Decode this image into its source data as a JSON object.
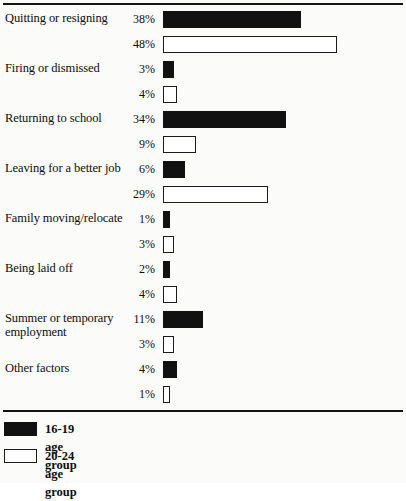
{
  "chart_data": {
    "type": "bar",
    "orientation": "horizontal",
    "title": "",
    "subtitle": "",
    "xlabel": "",
    "ylabel": "",
    "grid": false,
    "xlim": [
      0,
      50
    ],
    "value_suffix": "%",
    "legend_position": "bottom-left",
    "categories": [
      "Quitting or resigning",
      "Firing or dismissed",
      "Returning to school",
      "Leaving for a better job",
      "Family moving/relocate",
      "Being laid off",
      "Summer or temporary\nemployment",
      "Other factors"
    ],
    "series": [
      {
        "name": "16-19 age group",
        "color": "#111111",
        "style": "filled",
        "values": [
          38,
          3,
          34,
          6,
          1,
          2,
          11,
          4
        ],
        "labels": [
          "38%",
          "3%",
          "34%",
          "6%",
          "1%",
          "2%",
          "11%",
          "4%"
        ]
      },
      {
        "name": "20-24 age group",
        "color": "#ffffff",
        "style": "hollow",
        "values": [
          48,
          4,
          9,
          29,
          3,
          4,
          3,
          1
        ],
        "labels": [
          "48%",
          "4%",
          "9%",
          "29%",
          "3%",
          "4%",
          "3%",
          "1%"
        ]
      }
    ]
  },
  "legend": {
    "items": [
      {
        "label": "16-19 age group",
        "style": "filled"
      },
      {
        "label": "20-24 age group",
        "style": "hollow"
      }
    ]
  }
}
